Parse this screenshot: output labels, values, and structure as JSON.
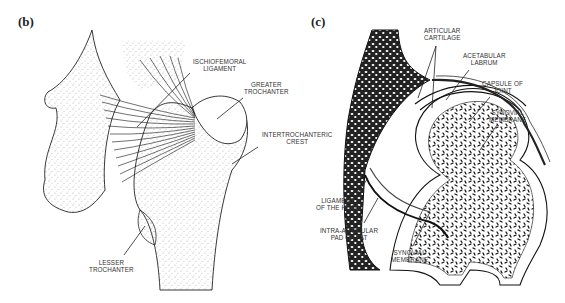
{
  "panels": [
    {
      "id": "b",
      "label": "(b)",
      "annotations": [
        {
          "text": "ISCHIOFEMORAL\nLIGAMENT"
        },
        {
          "text": "GREATER\nTROCHANTER"
        },
        {
          "text": "INTERTROCHANTERIC\nCREST"
        },
        {
          "text": "LESSER\nTROCHANTER"
        }
      ]
    },
    {
      "id": "c",
      "label": "(c)",
      "annotations": [
        {
          "text": "ARTICULAR\nCARTILAGE"
        },
        {
          "text": "ACETABULAR\nLABRUM"
        },
        {
          "text": "CAPSULE OF\nJOINT"
        },
        {
          "text": "SYNOVIAL\nMEMBRANE"
        },
        {
          "text": "LIGAMENT\nOF THE HEAD"
        },
        {
          "text": "INTRA-ARTICULAR\nPAD OF FAT"
        },
        {
          "text": "SYNOVIAL\nMEMBRANE"
        }
      ]
    }
  ]
}
